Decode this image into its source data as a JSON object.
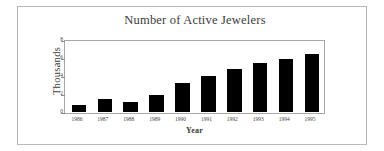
{
  "chart_data": {
    "type": "bar",
    "title": "Number of Active Jewelers",
    "xlabel": "Year",
    "ylabel": "Thousands",
    "categories": [
      "1986",
      "1987",
      "1988",
      "1989",
      "1990",
      "1991",
      "1992",
      "1993",
      "1994",
      "1995"
    ],
    "values": [
      0.8,
      1.5,
      1.1,
      1.9,
      3.2,
      4.0,
      4.8,
      5.5,
      5.9,
      6.4
    ],
    "ylim": [
      0,
      8
    ],
    "yticks": [
      "0",
      "2",
      "4",
      "6",
      "8"
    ],
    "ytick_values": [
      0,
      2,
      4,
      6,
      8
    ],
    "grid": false,
    "legend": false,
    "bar_color": "#000000",
    "frame_color": "#a8a8a8"
  },
  "figure": {
    "border_color": "#b9b9b9",
    "background": "#ffffff"
  }
}
